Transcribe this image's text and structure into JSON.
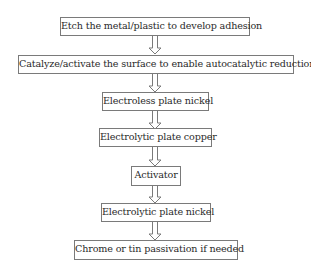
{
  "flowchart": {
    "steps": [
      {
        "label": "Etch the metal/plastic to develop adhesion"
      },
      {
        "label": "Catalyze/activate the surface to enable autocatalytic reduction"
      },
      {
        "label": "Electroless plate nickel"
      },
      {
        "label": "Electrolytic plate copper"
      },
      {
        "label": "Activator"
      },
      {
        "label": "Electrolytic plate nickel"
      },
      {
        "label": "Chrome or tin passivation if needed"
      }
    ],
    "arrow_style": "hollow-down-arrow",
    "colors": {
      "border": "#7a7a7a",
      "text": "#2a2a2a",
      "background": "#ffffff"
    }
  }
}
